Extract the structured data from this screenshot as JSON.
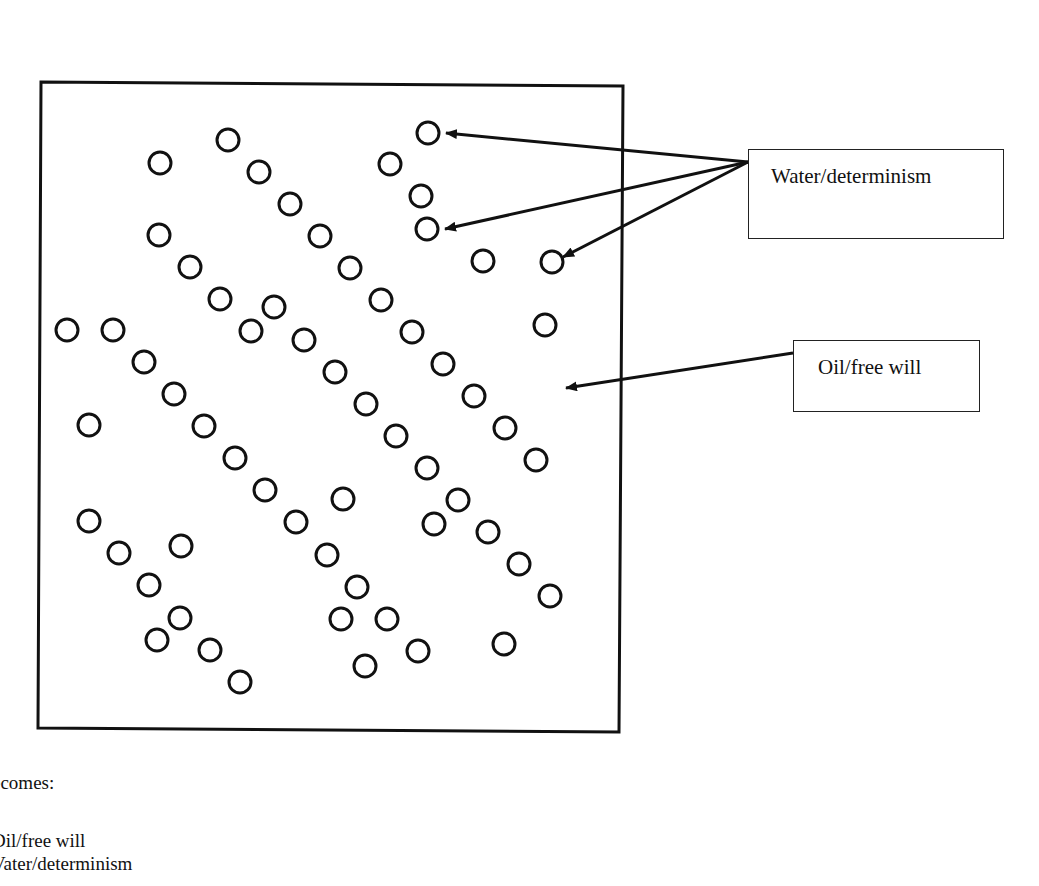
{
  "diagram": {
    "frame": {
      "x1": 41,
      "y1": 82,
      "x2": 623,
      "y2": 86,
      "x3": 619,
      "y3": 732,
      "x4": 38,
      "y4": 728
    },
    "circle_radius": 11,
    "stroke_color": "#111111",
    "circles": [
      [
        228,
        140
      ],
      [
        160,
        163
      ],
      [
        259,
        172
      ],
      [
        390,
        164
      ],
      [
        428,
        133
      ],
      [
        421,
        196
      ],
      [
        427,
        229
      ],
      [
        290,
        204
      ],
      [
        320,
        236
      ],
      [
        350,
        268
      ],
      [
        381,
        300
      ],
      [
        412,
        332
      ],
      [
        443,
        364
      ],
      [
        474,
        396
      ],
      [
        505,
        428
      ],
      [
        536,
        460
      ],
      [
        159,
        235
      ],
      [
        190,
        267
      ],
      [
        220,
        299
      ],
      [
        251,
        331
      ],
      [
        274,
        307
      ],
      [
        304,
        340
      ],
      [
        335,
        372
      ],
      [
        366,
        404
      ],
      [
        396,
        436
      ],
      [
        427,
        468
      ],
      [
        458,
        500
      ],
      [
        488,
        532
      ],
      [
        519,
        564
      ],
      [
        550,
        596
      ],
      [
        483,
        261
      ],
      [
        552,
        262
      ],
      [
        545,
        325
      ],
      [
        67,
        330
      ],
      [
        113,
        330
      ],
      [
        144,
        362
      ],
      [
        174,
        394
      ],
      [
        204,
        426
      ],
      [
        235,
        458
      ],
      [
        265,
        490
      ],
      [
        296,
        522
      ],
      [
        327,
        555
      ],
      [
        357,
        587
      ],
      [
        387,
        619
      ],
      [
        418,
        651
      ],
      [
        89,
        425
      ],
      [
        343,
        499
      ],
      [
        434,
        524
      ],
      [
        89,
        521
      ],
      [
        119,
        553
      ],
      [
        181,
        546
      ],
      [
        149,
        585
      ],
      [
        180,
        618
      ],
      [
        157,
        640
      ],
      [
        210,
        650
      ],
      [
        240,
        682
      ],
      [
        341,
        619
      ],
      [
        365,
        666
      ],
      [
        504,
        644
      ]
    ],
    "callouts": [
      {
        "label": "Water/determinism",
        "box": {
          "left": 748,
          "top": 149,
          "width": 256,
          "height": 90
        },
        "text_pos": {
          "left": 22,
          "top": 14
        },
        "origin": [
          748,
          162
        ],
        "targets": [
          [
            446,
            133
          ],
          [
            445,
            229
          ],
          [
            563,
            257
          ]
        ]
      },
      {
        "label": "Oil/free will",
        "box": {
          "left": 793,
          "top": 340,
          "width": 187,
          "height": 72
        },
        "text_pos": {
          "left": 24,
          "top": 14
        },
        "origin": [
          793,
          353
        ],
        "targets": [
          [
            566,
            388
          ]
        ]
      }
    ]
  },
  "caption": {
    "line1": "ecomes:",
    "line2": "Dil/free will",
    "line3": "Vater/determinism"
  }
}
